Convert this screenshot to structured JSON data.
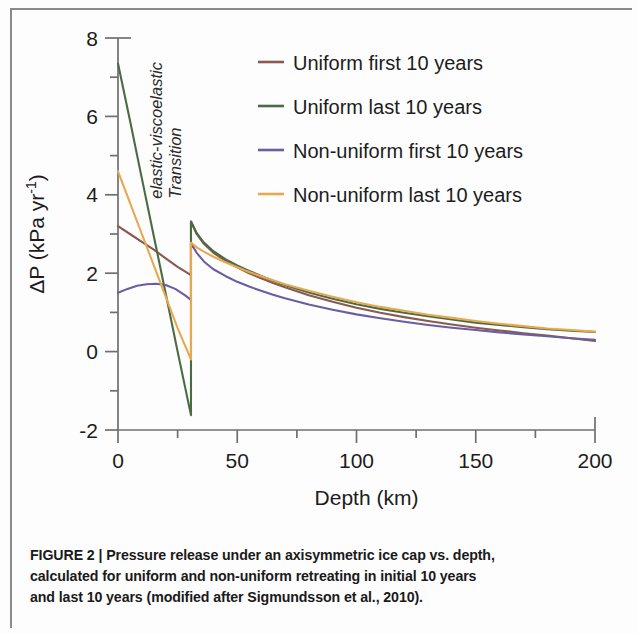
{
  "figure": {
    "caption_lines": [
      "FIGURE 2 | Pressure release under an axisymmetric ice cap vs. depth,",
      "calculated for uniform and non-uniform retreating in initial 10 years",
      "and last 10 years (modified after Sigmundsson et al., 2010)."
    ]
  },
  "chart_data": {
    "type": "line",
    "title": "",
    "xlabel": "Depth (km)",
    "ylabel": "ΔP (kPa yr⁻¹)",
    "xlim": [
      0,
      200
    ],
    "ylim": [
      -2,
      8
    ],
    "xticks": [
      0,
      50,
      100,
      150,
      200
    ],
    "xtick_labels": [
      "0",
      "50",
      "100",
      "150",
      "200"
    ],
    "xminor_ticks": [
      25,
      75,
      125,
      175
    ],
    "yticks": [
      -2,
      0,
      2,
      4,
      6,
      8
    ],
    "ytick_labels": [
      "-2",
      "0",
      "2",
      "4",
      "6",
      "8"
    ],
    "yminor_ticks": [
      -1,
      1,
      3,
      5,
      7
    ],
    "grid": false,
    "legend_position": "upper right",
    "annotations": [
      {
        "text_lines": [
          "Transition",
          "elastic-viscoelastic"
        ],
        "x": 30.6,
        "rotation": -90,
        "style": "italic"
      }
    ],
    "transition_depth_km": 30.6,
    "series": [
      {
        "name": "Uniform first 10 years",
        "color": "#8a5a4e",
        "x": [
          0,
          5,
          10,
          15,
          20,
          25,
          30.6,
          30.6,
          33,
          36,
          40,
          45,
          50,
          55,
          60,
          65,
          70,
          80,
          90,
          100,
          110,
          120,
          130,
          140,
          150,
          160,
          170,
          180,
          190,
          200
        ],
        "y": [
          3.2,
          3.0,
          2.8,
          2.6,
          2.38,
          2.16,
          1.95,
          3.32,
          3.0,
          2.75,
          2.52,
          2.32,
          2.15,
          2.0,
          1.87,
          1.75,
          1.64,
          1.44,
          1.27,
          1.12,
          0.99,
          0.88,
          0.78,
          0.69,
          0.61,
          0.54,
          0.47,
          0.41,
          0.34,
          0.27
        ]
      },
      {
        "name": "Uniform last 10 years",
        "color": "#4b6b44",
        "x": [
          0,
          5,
          10,
          15,
          20,
          25,
          30.6,
          30.6,
          33,
          36,
          40,
          45,
          50,
          55,
          60,
          65,
          70,
          80,
          90,
          100,
          110,
          120,
          130,
          140,
          150,
          160,
          170,
          180,
          190,
          200
        ],
        "y": [
          7.35,
          5.9,
          4.42,
          2.95,
          1.48,
          0.0,
          -1.62,
          3.32,
          3.02,
          2.78,
          2.56,
          2.36,
          2.2,
          2.06,
          1.93,
          1.81,
          1.7,
          1.51,
          1.35,
          1.21,
          1.09,
          0.99,
          0.9,
          0.82,
          0.74,
          0.68,
          0.62,
          0.57,
          0.53,
          0.5
        ]
      },
      {
        "name": "Non-uniform first 10 years",
        "color": "#6a5ea0",
        "x": [
          0,
          4,
          8,
          12,
          16,
          20,
          24,
          28,
          30.6,
          30.6,
          33,
          36,
          40,
          45,
          50,
          55,
          60,
          65,
          70,
          80,
          90,
          100,
          110,
          120,
          130,
          140,
          150,
          160,
          170,
          180,
          190,
          200
        ],
        "y": [
          1.5,
          1.6,
          1.68,
          1.72,
          1.73,
          1.7,
          1.6,
          1.44,
          1.32,
          2.76,
          2.52,
          2.3,
          2.1,
          1.93,
          1.78,
          1.66,
          1.55,
          1.45,
          1.36,
          1.2,
          1.07,
          0.95,
          0.85,
          0.76,
          0.68,
          0.61,
          0.55,
          0.49,
          0.44,
          0.39,
          0.34,
          0.3
        ]
      },
      {
        "name": "Non-uniform last 10 years",
        "color": "#e8a84f",
        "x": [
          0,
          5,
          10,
          15,
          20,
          25,
          30.6,
          30.6,
          33,
          36,
          40,
          45,
          50,
          55,
          60,
          65,
          70,
          80,
          90,
          100,
          110,
          120,
          130,
          140,
          150,
          160,
          170,
          180,
          190,
          200
        ],
        "y": [
          4.6,
          3.8,
          3.0,
          2.2,
          1.4,
          0.6,
          -0.2,
          2.78,
          2.66,
          2.55,
          2.42,
          2.28,
          2.15,
          2.03,
          1.92,
          1.82,
          1.72,
          1.55,
          1.4,
          1.26,
          1.14,
          1.04,
          0.94,
          0.86,
          0.78,
          0.71,
          0.65,
          0.59,
          0.55,
          0.51
        ]
      }
    ]
  }
}
